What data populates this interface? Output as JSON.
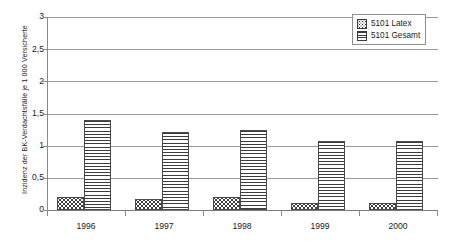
{
  "chart_data": {
    "type": "bar",
    "title": "",
    "subtitle": "",
    "xlabel": "",
    "ylabel": "Inzidenz der BK-Verdachtsfälle je 1 000 Versicherte",
    "categories": [
      "1996",
      "1997",
      "1998",
      "1999",
      "2000"
    ],
    "series": [
      {
        "name": "5101 Latex",
        "values": [
          0.2,
          0.17,
          0.21,
          0.11,
          0.11
        ],
        "pattern": "dotted",
        "color": "#2f2f2f"
      },
      {
        "name": "5101 Gesamt",
        "values": [
          1.4,
          1.22,
          1.24,
          1.07,
          1.08
        ],
        "pattern": "horizontal-lines",
        "color": "#3c3c3c"
      }
    ],
    "ylim": [
      0,
      3
    ],
    "y_ticks": [
      0,
      0.5,
      1,
      1.5,
      2,
      2.5,
      3
    ],
    "y_tick_labels": [
      "0",
      "0,5",
      "1",
      "1,5",
      "2",
      "2,5",
      "3"
    ],
    "grid": true,
    "grid_axis": "y",
    "legend_position": "top-right",
    "legend_entries": [
      "5101 Latex",
      "5101 Gesamt"
    ],
    "frame_color": "#8a8a8a",
    "background": "#ffffff"
  }
}
